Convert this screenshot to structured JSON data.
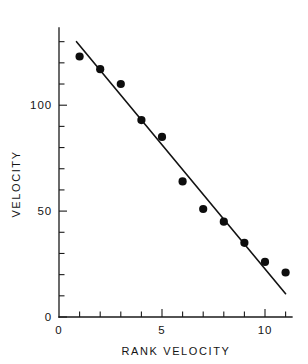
{
  "chart_data": {
    "type": "scatter",
    "title": "",
    "subtitle": "",
    "xlabel": "RANK VELOCITY",
    "ylabel": "VELOCITY",
    "xlim": [
      0,
      11.6
    ],
    "ylim": [
      0,
      136
    ],
    "grid": false,
    "legend": null,
    "x_tick_labels": [
      "0",
      "5",
      "10"
    ],
    "x_tick_values": [
      0,
      5,
      10
    ],
    "x_minor_ticks": [
      1,
      2,
      3,
      4,
      6,
      7,
      8,
      9,
      11
    ],
    "y_tick_labels": [
      "0",
      "50",
      "100"
    ],
    "y_tick_values": [
      0,
      50,
      100
    ],
    "y_minor_ticks": [
      10,
      20,
      30,
      40,
      60,
      70,
      80,
      90,
      110,
      120,
      130
    ],
    "series": [
      {
        "name": "observations",
        "marker": "filled-circle",
        "color": "#0d0d0d",
        "x": [
          1,
          2,
          3,
          4,
          5,
          6,
          7,
          8,
          9,
          10,
          11
        ],
        "values": [
          123,
          117,
          110,
          93,
          85,
          64,
          51,
          45,
          35,
          26,
          21
        ]
      },
      {
        "name": "fitted-line",
        "marker": "none",
        "color": "#131313",
        "x": [
          0.85,
          11.0
        ],
        "values": [
          130,
          11
        ]
      }
    ]
  },
  "figure": {
    "axis_color": "#1a1a1a",
    "marker_color": "#0d0d0d",
    "line_color": "#131313",
    "background": "#ffffff",
    "marker_radius_px": 4.1
  }
}
